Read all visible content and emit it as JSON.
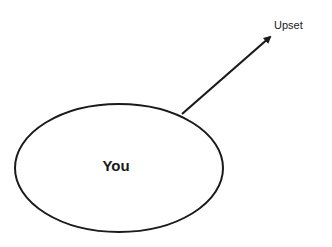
{
  "diagram": {
    "center_node": {
      "label": "You",
      "shape": "ellipse"
    },
    "target_node": {
      "label": "Upset"
    },
    "edge": {
      "from": "You",
      "to": "Upset",
      "type": "arrow"
    },
    "colors": {
      "stroke": "#1a1a1a",
      "background": "#ffffff"
    }
  }
}
